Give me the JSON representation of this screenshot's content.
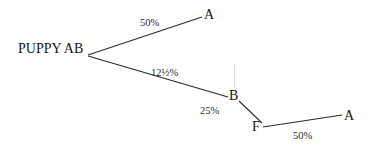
{
  "diagram": {
    "type": "pedigree-tree",
    "root": {
      "label": "PUPPY AB"
    },
    "nodes": [
      {
        "id": "a_top",
        "label": "A"
      },
      {
        "id": "b",
        "label": "B"
      },
      {
        "id": "f",
        "label": "F"
      },
      {
        "id": "a_bottom",
        "label": "A"
      }
    ],
    "edges": [
      {
        "from": "root",
        "to": "a_top",
        "label": "50%"
      },
      {
        "from": "root",
        "to": "b",
        "label": "12½%"
      },
      {
        "from": "b",
        "to": "f",
        "label": "25%"
      },
      {
        "from": "f",
        "to": "a_bottom",
        "label": "50%"
      }
    ]
  }
}
